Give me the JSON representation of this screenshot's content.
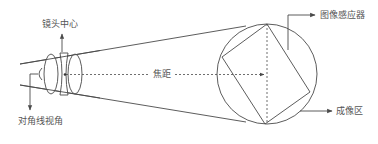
{
  "diagram": {
    "title": "",
    "labels": {
      "lens_center": "镜头中心",
      "diagonal_fov": "对角线视角",
      "focal_length": "焦距",
      "image_sensor": "图像感应器",
      "imaging_area": "成像区"
    },
    "colors": {
      "line": "#4a4a4a",
      "text": "#555555",
      "background": "#ffffff"
    },
    "elements": [
      {
        "id": "lens",
        "type": "lens-group",
        "components": [
          "convex-lens",
          "concave-lens",
          "convex-lens"
        ]
      },
      {
        "id": "view-cone",
        "type": "lines",
        "from": "lens-center",
        "to": "imaging-circle"
      },
      {
        "id": "focal-axis",
        "type": "dashed-arrow",
        "label": "焦距"
      },
      {
        "id": "imaging-circle",
        "type": "circle",
        "label": "成像区"
      },
      {
        "id": "sensor-rect",
        "type": "rotated-rectangle",
        "label": "图像感应器"
      },
      {
        "id": "diagonal-angle",
        "type": "arc",
        "label": "对角线视角"
      }
    ]
  }
}
